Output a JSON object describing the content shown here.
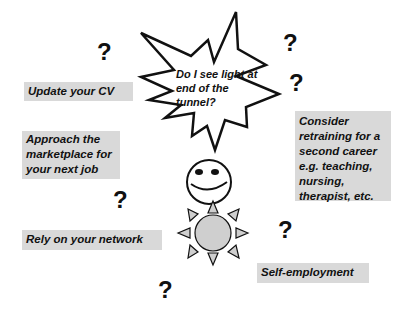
{
  "question_mark": "?",
  "starburst": {
    "lines": [
      "Do I see light at",
      "end of the",
      "tunnel?"
    ]
  },
  "options": {
    "update_cv": {
      "lines": [
        "Update your CV"
      ]
    },
    "approach_marketplace": {
      "lines": [
        "Approach the",
        "marketplace for",
        "your next job"
      ]
    },
    "rely_network": {
      "lines": [
        "Rely on your network"
      ]
    },
    "retraining": {
      "lines": [
        "Consider",
        "retraining for a",
        "second career",
        "e.g. teaching,",
        "nursing,",
        "therapist, etc."
      ]
    },
    "self_employment": {
      "lines": [
        "Self-employment"
      ]
    }
  },
  "icons": [
    "starburst-shape",
    "smiley-face-icon",
    "sun-icon",
    "question-mark-icon"
  ],
  "colors": {
    "box_fill": "#d9d9d9",
    "sun_fill": "#cfcfcf",
    "stroke": "#111111",
    "background": "#ffffff"
  }
}
